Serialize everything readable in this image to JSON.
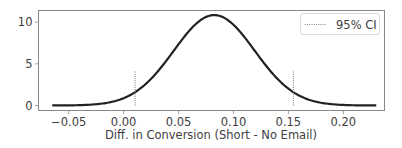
{
  "chart_data": {
    "type": "line",
    "title": "",
    "xlabel": "Diff. in Conversion (Short - No Email)",
    "ylabel": "",
    "xlim": [
      -0.0775,
      0.2375
    ],
    "ylim": [
      -0.6,
      11.4
    ],
    "x_ticks": [
      -0.05,
      0.0,
      0.05,
      0.1,
      0.15,
      0.2
    ],
    "x_tick_labels": [
      "−0.05",
      "0.00",
      "0.05",
      "0.10",
      "0.15",
      "0.20"
    ],
    "y_ticks": [
      0,
      5,
      10
    ],
    "y_tick_labels": [
      "0",
      "5",
      "10"
    ],
    "grid": false,
    "legend": {
      "position": "upper right",
      "entries": [
        "95% CI"
      ]
    },
    "series": [
      {
        "name": "posterior density",
        "style": "solid",
        "color": "#222222",
        "distribution": "normal",
        "mean": 0.0825,
        "sd": 0.0368,
        "x_range": [
          -0.065,
          0.23
        ],
        "peak_y": 10.85
      }
    ],
    "annotations": [
      {
        "type": "vline",
        "label": "95% CI",
        "x": 0.0104,
        "y_from": 0,
        "y_to": 4.2,
        "style": "dotted",
        "color": "#888888"
      },
      {
        "type": "vline",
        "label": "95% CI",
        "x": 0.1546,
        "y_from": 0,
        "y_to": 4.2,
        "style": "dotted",
        "color": "#888888"
      }
    ]
  },
  "legend": {
    "label": "95% CI"
  },
  "axes": {
    "xlabel": "Diff. in Conversion (Short - No Email)"
  }
}
